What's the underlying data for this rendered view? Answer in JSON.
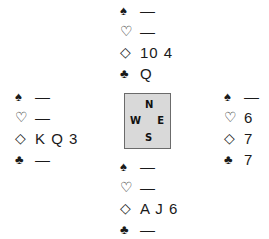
{
  "suits": {
    "spade": "♠",
    "heart": "♡",
    "diamond": "◇",
    "club": "♣"
  },
  "hands": {
    "north": {
      "spades": "—",
      "hearts": "—",
      "diamonds": "10 4",
      "clubs": "Q"
    },
    "west": {
      "spades": "—",
      "hearts": "—",
      "diamonds": "K Q 3",
      "clubs": "—"
    },
    "east": {
      "spades": "—",
      "hearts": "6",
      "diamonds": "7",
      "clubs": "7"
    },
    "south": {
      "spades": "—",
      "hearts": "—",
      "diamonds": "A J 6",
      "clubs": "—"
    }
  },
  "compass": {
    "n": "N",
    "w": "W",
    "e": "E",
    "s": "S"
  },
  "colors": {
    "compass_bg": "#d9d9d9",
    "compass_border": "#6b6b6b",
    "text": "#1a1a1a"
  }
}
